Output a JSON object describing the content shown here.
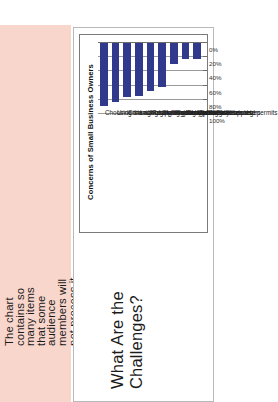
{
  "annotation": {
    "text": "The chart\ncontains so\nmany items\nthat some\naudience\nmembers will\nnot process it\neasily.",
    "background": "#f8d6cb"
  },
  "slide": {
    "title": "What Are the Challenges?"
  },
  "chart_data": {
    "type": "bar",
    "orientation": "vertical",
    "title": "Concerns of Small Business Owners",
    "categories": [
      "Choosing the right suppliers/manufacturers",
      "Understanding government bureaucracy",
      "Communicating effectively with Chinese",
      "Lack of on-the-ground presence",
      "Resolving contractual/legal disputes",
      "Finding the right talent to manage",
      "Finding translators/interpreters",
      "Corruption/inside deals",
      "Getting licenses and permits"
    ],
    "values": [
      89,
      83,
      76,
      75,
      68,
      62,
      30,
      23,
      22
    ],
    "tick_labels": [
      "0%",
      "20%",
      "40%",
      "60%",
      "80%",
      "100%"
    ],
    "ticks": [
      0,
      20,
      40,
      60,
      80,
      100
    ],
    "xlabel": "",
    "ylabel": "",
    "xlim": [
      0,
      100
    ],
    "grid": true,
    "legend": false,
    "bar_color": "#31398c"
  }
}
